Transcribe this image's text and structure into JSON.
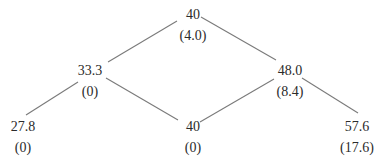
{
  "tree": {
    "nodes": [
      {
        "id": "root",
        "value": "40",
        "sub": "(4.0)",
        "cx": 193,
        "top": 6
      },
      {
        "id": "up",
        "value": "48.0",
        "sub": "(8.4)",
        "cx": 290,
        "top": 62
      },
      {
        "id": "down",
        "value": "33.3",
        "sub": "(0)",
        "cx": 90,
        "top": 62
      },
      {
        "id": "up-up",
        "value": "57.6",
        "sub": "(17.6)",
        "cx": 357,
        "top": 118
      },
      {
        "id": "up-down",
        "value": "40",
        "sub": "(0)",
        "cx": 193,
        "top": 118
      },
      {
        "id": "down-down",
        "value": "27.8",
        "sub": "(0)",
        "cx": 23,
        "top": 118
      }
    ],
    "edges": [
      {
        "from": "root",
        "to": "up",
        "x1": 201,
        "y1": 17,
        "x2": 276,
        "y2": 60
      },
      {
        "from": "root",
        "to": "down",
        "x1": 177,
        "y1": 21,
        "x2": 108,
        "y2": 62
      },
      {
        "from": "down",
        "to": "down-down",
        "x1": 78,
        "y1": 82,
        "x2": 26,
        "y2": 115
      },
      {
        "from": "down",
        "to": "up-down",
        "x1": 106,
        "y1": 78,
        "x2": 178,
        "y2": 120
      },
      {
        "from": "up",
        "to": "up-down",
        "x1": 274,
        "y1": 79,
        "x2": 200,
        "y2": 122
      },
      {
        "from": "up",
        "to": "up-up",
        "x1": 302,
        "y1": 78,
        "x2": 358,
        "y2": 113
      }
    ]
  },
  "colors": {
    "text": "#2b2b2b",
    "edge": "#7a7a7a",
    "background": "#ffffff"
  }
}
